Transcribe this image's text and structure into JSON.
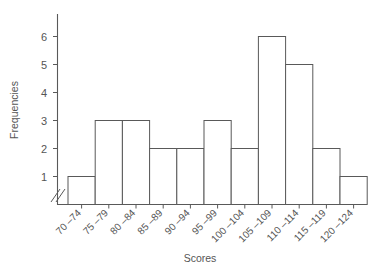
{
  "chart_data": {
    "type": "bar",
    "title": "",
    "subtitle": "",
    "xlabel": "Scores",
    "ylabel": "Frequencies",
    "categories": [
      "70 –74",
      "75 –79",
      "80 –84",
      "85 –89",
      "90 –94",
      "95 –99",
      "100 –104",
      "105 –109",
      "110 –114",
      "115 –119",
      "120 –124"
    ],
    "values": [
      1,
      3,
      3,
      2,
      2,
      3,
      2,
      6,
      5,
      2,
      1
    ],
    "ytick_labels": [
      "1",
      "2",
      "3",
      "4",
      "5",
      "6"
    ],
    "yticks": [
      1,
      2,
      3,
      4,
      5,
      6
    ],
    "ylim": [
      0,
      6.8
    ],
    "grid": false,
    "legend": null,
    "axis_break": "//",
    "bar_fill": "#ffffff",
    "bar_stroke": "#595959",
    "axis_color": "#595959",
    "text_color": "#555555",
    "background": "#ffffff"
  }
}
